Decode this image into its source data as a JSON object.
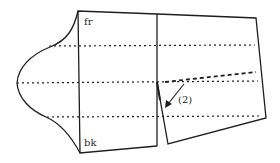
{
  "diagram": {
    "type": "pattern-drafting",
    "colors": {
      "line": "#1e1e1e",
      "background": "#ffffff"
    },
    "labels": {
      "front": "fr",
      "back": "bk",
      "step": "(2)"
    }
  }
}
